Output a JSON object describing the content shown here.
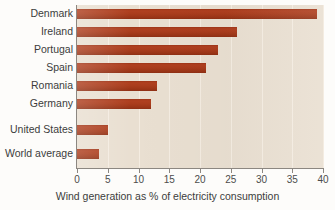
{
  "chart_data": {
    "type": "bar",
    "orientation": "horizontal",
    "title": "",
    "xlabel": "Wind generation as % of electricity consumption",
    "ylabel": "",
    "categories": [
      "Denmark",
      "Ireland",
      "Portugal",
      "Spain",
      "Romania",
      "Germany",
      "United States",
      "World average"
    ],
    "values": [
      39,
      26,
      23,
      21,
      13,
      12,
      5,
      3.5
    ],
    "xlim": [
      0,
      40
    ],
    "xticks": [
      0,
      5,
      10,
      15,
      20,
      25,
      30,
      35,
      40
    ],
    "xtick_labels": [
      "0",
      "5",
      "10",
      "15",
      "20",
      "25",
      "30",
      "35",
      "40"
    ],
    "grid": "vertical",
    "legend": "none",
    "bar_color": "#ad3c1c",
    "plot_background": "#e9dfd1",
    "gridline_color": "#f4ece1",
    "axis_color": "#8c8781",
    "text_color": "#3c3c3c"
  },
  "axis": {
    "x_title": "Wind generation as % of electricity consumption"
  },
  "rows": [
    {
      "label": "Denmark",
      "value": 39
    },
    {
      "label": "Ireland",
      "value": 26
    },
    {
      "label": "Portugal",
      "value": 23
    },
    {
      "label": "Spain",
      "value": 21
    },
    {
      "label": "Romania",
      "value": 13
    },
    {
      "label": "Germany",
      "value": 12
    },
    {
      "label": "United States",
      "value": 5
    },
    {
      "label": "World average",
      "value": 3.5
    }
  ],
  "ticks": [
    {
      "label": "0",
      "value": 0
    },
    {
      "label": "5",
      "value": 5
    },
    {
      "label": "10",
      "value": 10
    },
    {
      "label": "15",
      "value": 15
    },
    {
      "label": "20",
      "value": 20
    },
    {
      "label": "25",
      "value": 25
    },
    {
      "label": "30",
      "value": 30
    },
    {
      "label": "35",
      "value": 35
    },
    {
      "label": "40",
      "value": 40
    }
  ]
}
